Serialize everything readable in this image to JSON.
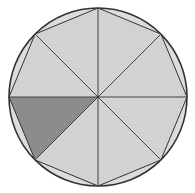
{
  "diagram": {
    "type": "circle-with-inscribed-regular-octagon",
    "circle": {
      "cx": 98,
      "cy": 97,
      "r": 89
    },
    "octagon_sides": 8,
    "sectors": 8,
    "shaded_sector_index": 5,
    "colors": {
      "background": "#ffffff",
      "circle_fill": "#dcdcdc",
      "octagon_fill": "#d2d2d2",
      "shaded_sector": "#8c8c8c",
      "stroke": "#333333"
    }
  }
}
